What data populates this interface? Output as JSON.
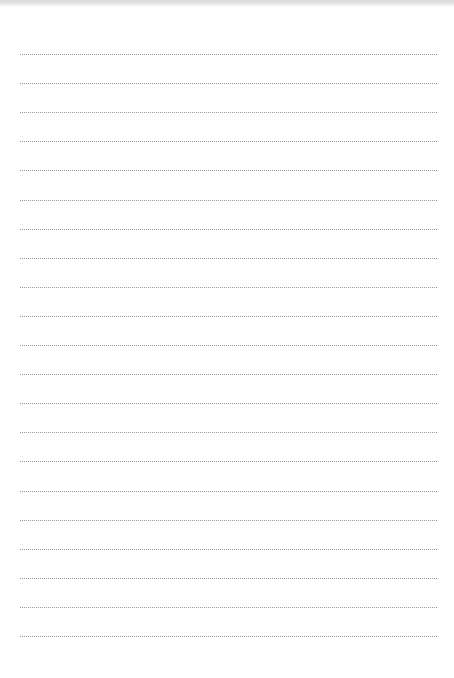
{
  "page": {
    "type": "lined-paper",
    "background": "#ffffff",
    "top_band_color": "#dcdcdc",
    "rule_color": "#9a9a9a",
    "rule_count": 21,
    "rule_start_y": 54,
    "rule_spacing": 29.1,
    "rule_left": 20,
    "rule_right": 437
  }
}
